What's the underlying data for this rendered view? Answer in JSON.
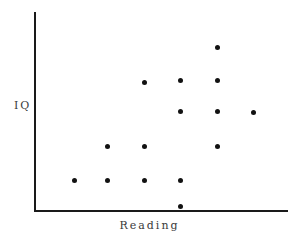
{
  "chart_data": {
    "type": "scatter",
    "title": "",
    "xlabel": "Reading",
    "ylabel": "IQ",
    "grid": false,
    "legend": null,
    "xlim": [
      0,
      10
    ],
    "ylim": [
      0,
      10
    ],
    "xticks": [],
    "yticks": [],
    "axis_color": "#1a1a1a",
    "point_color": "#121212",
    "background_color": "#ffffff",
    "point_count": 14,
    "points": [
      {
        "x": 1.6,
        "y": 1.5,
        "px": 74,
        "py": 180
      },
      {
        "x": 2.9,
        "y": 1.5,
        "px": 107,
        "py": 180
      },
      {
        "x": 4.3,
        "y": 1.5,
        "px": 144,
        "py": 180
      },
      {
        "x": 5.8,
        "y": 1.5,
        "px": 180,
        "py": 180
      },
      {
        "x": 5.8,
        "y": 0.2,
        "px": 180,
        "py": 206
      },
      {
        "x": 2.9,
        "y": 3.2,
        "px": 107,
        "py": 146
      },
      {
        "x": 4.3,
        "y": 3.2,
        "px": 144,
        "py": 146
      },
      {
        "x": 7.2,
        "y": 3.2,
        "px": 217,
        "py": 146
      },
      {
        "x": 5.8,
        "y": 5.0,
        "px": 180,
        "py": 111
      },
      {
        "x": 7.2,
        "y": 5.0,
        "px": 217,
        "py": 111
      },
      {
        "x": 8.6,
        "y": 5.0,
        "px": 253,
        "py": 112
      },
      {
        "x": 4.3,
        "y": 6.5,
        "px": 144,
        "py": 82
      },
      {
        "x": 5.8,
        "y": 6.5,
        "px": 180,
        "py": 80
      },
      {
        "x": 7.2,
        "y": 6.5,
        "px": 217,
        "py": 80
      },
      {
        "x": 7.2,
        "y": 8.2,
        "px": 217,
        "py": 47
      }
    ]
  },
  "axes": {
    "y_label": "IQ",
    "x_label": "Reading"
  }
}
